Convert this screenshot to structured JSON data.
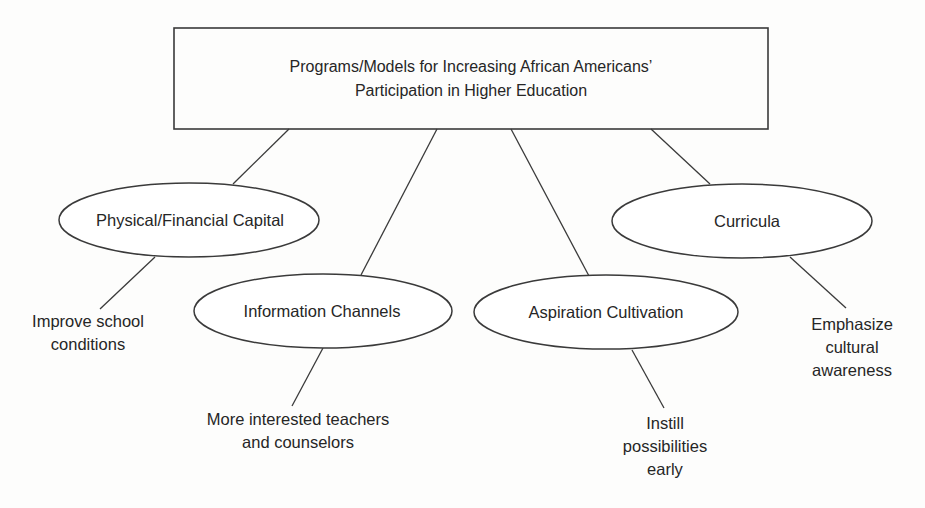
{
  "root": {
    "title_line1": "Programs/Models for Increasing African Americans’",
    "title_line2": "Participation in Higher Education"
  },
  "categories": [
    {
      "label": "Physical/Financial Capital",
      "outcome": [
        "Improve school",
        "conditions"
      ]
    },
    {
      "label": "Information Channels",
      "outcome": [
        "More interested teachers",
        "and counselors"
      ]
    },
    {
      "label": "Aspiration Cultivation",
      "outcome": [
        "Instill",
        "possibilities",
        "early"
      ]
    },
    {
      "label": "Curricula",
      "outcome": [
        "Emphasize",
        "cultural",
        "awareness"
      ]
    }
  ],
  "colors": {
    "stroke": "#3a3a3a",
    "text": "#262626",
    "background": "#fdfdfc"
  }
}
